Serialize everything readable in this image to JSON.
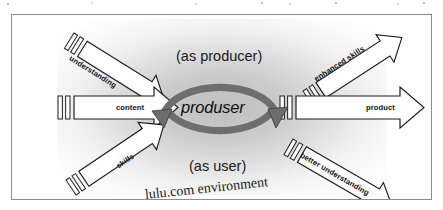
{
  "figure": {
    "center_label": "produser",
    "roles": {
      "top": "(as producer)",
      "bottom": "(as user)"
    },
    "environment_label": "lulu.com environment",
    "inputs": [
      {
        "id": "understanding",
        "label": "understanding",
        "position": "top-left",
        "direction": "down-right"
      },
      {
        "id": "content",
        "label": "content",
        "position": "left",
        "direction": "right"
      },
      {
        "id": "skills",
        "label": "skills",
        "position": "bottom-left",
        "direction": "up-right"
      }
    ],
    "outputs": [
      {
        "id": "enhanced-skills",
        "label": "enhanced skills",
        "position": "top-right",
        "direction": "up-right"
      },
      {
        "id": "product",
        "label": "product",
        "position": "right",
        "direction": "right"
      },
      {
        "id": "better-understanding",
        "label": "better understanding",
        "position": "bottom-right",
        "direction": "down-right"
      }
    ],
    "cycle": {
      "arrowheads": 2,
      "description": "circular two-headed cycle arrow around the produser label"
    },
    "colors": {
      "frame_border": "#8c8c8c",
      "arrow_fill": "#ffffff",
      "arrow_stroke": "#1a1a1a",
      "cycle_arrow": "#6e6e6e",
      "cycle_arrow_dark": "#4a4a4a",
      "glow": "#a0a0a0",
      "text": "#141414",
      "page_background": "#ffffff"
    }
  }
}
